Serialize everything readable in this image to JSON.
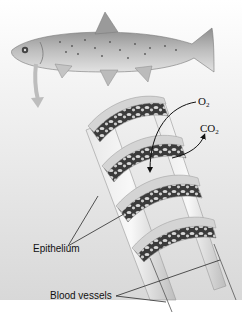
{
  "figure": {
    "labels": {
      "oxygen": "O",
      "oxygen_sub": "2",
      "carbon_dioxide": "CO",
      "carbon_dioxide_sub": "2",
      "epithelium": "Epithelium",
      "blood_vessels": "Blood vessels"
    },
    "colors": {
      "background_top": "#ffffff",
      "background_bottom": "#d9d9d9",
      "gill_network": "#3a3a3a",
      "gill_frame": "#cfcfcf",
      "fish_body": "#b5b5b5",
      "label_text": "#111111"
    }
  }
}
